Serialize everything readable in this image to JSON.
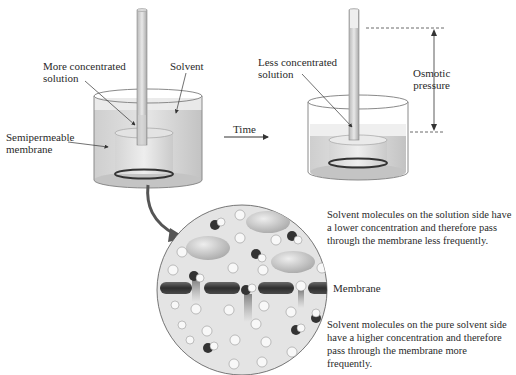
{
  "diagram": {
    "left_beaker": {
      "labels": {
        "concentrated": "More concentrated\nsolution",
        "solvent": "Solvent",
        "membrane": "Semipermeable\nmembrane"
      }
    },
    "time_arrow": {
      "label": "Time"
    },
    "right_beaker": {
      "labels": {
        "dilute": "Less concentrated\nsolution",
        "osmotic_pressure": "Osmotic\npressure"
      }
    },
    "magnified_view": {
      "membrane_label": "Membrane",
      "top_text": "Solvent molecules on the solution side have a lower concentration and therefore pass through the membrane less frequently.",
      "bottom_text": "Solvent molecules on the pure solvent side have a higher concentration and therefore pass through the membrane more frequently."
    },
    "colors": {
      "liquid": "#d9d9d9",
      "glass": "#bdbdbd",
      "membrane": "#3a3a3a",
      "circle_bg": "#e6e6e6",
      "solute": "#cfcfcf"
    }
  }
}
